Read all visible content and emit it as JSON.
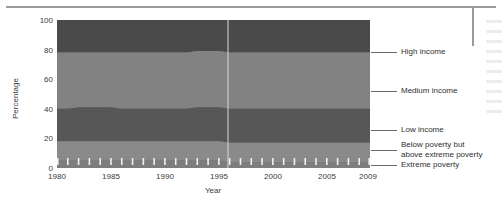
{
  "chart_data": {
    "type": "area",
    "title": "",
    "xlabel": "Year",
    "ylabel": "Percentage",
    "xlim": [
      1980,
      2009
    ],
    "ylim": [
      0,
      100
    ],
    "grid": false,
    "legend_position": "right",
    "stacked": true,
    "x_tick_labels": [
      "1980",
      "1985",
      "1990",
      "1995",
      "2000",
      "2005",
      "2009"
    ],
    "x_tick_values": [
      1980,
      1985,
      1990,
      1995,
      2000,
      2005,
      2009
    ],
    "y_tick_labels": [
      "0",
      "20",
      "40",
      "60",
      "80",
      "100"
    ],
    "y_tick_values": [
      0,
      20,
      40,
      60,
      80,
      100
    ],
    "x": [
      1980,
      1981,
      1982,
      1983,
      1984,
      1985,
      1986,
      1987,
      1988,
      1989,
      1990,
      1991,
      1992,
      1993,
      1994,
      1995,
      1996,
      1997,
      1998,
      1999,
      2000,
      2001,
      2002,
      2003,
      2004,
      2005,
      2006,
      2007,
      2008,
      2009
    ],
    "series": [
      {
        "name": "Extreme poverty",
        "color": "#7d7d7d",
        "values": [
          5,
          5,
          5,
          5,
          5,
          5,
          5,
          5,
          5,
          5,
          5,
          5,
          5,
          5,
          5,
          5,
          4,
          4,
          4,
          4,
          4,
          4,
          4,
          4,
          4,
          4,
          4,
          4,
          4,
          4
        ]
      },
      {
        "name": "Below poverty but above extreme poverty",
        "color": "#8a8a8a",
        "values": [
          13,
          13,
          13,
          13,
          13,
          13,
          13,
          13,
          13,
          13,
          13,
          13,
          13,
          13,
          13,
          13,
          13,
          13,
          13,
          13,
          13,
          13,
          13,
          13,
          13,
          13,
          13,
          13,
          13,
          13
        ]
      },
      {
        "name": "Low income",
        "color": "#575757",
        "values": [
          22,
          22,
          23,
          23,
          23,
          23,
          22,
          22,
          22,
          22,
          22,
          22,
          22,
          23,
          23,
          23,
          23,
          23,
          23,
          23,
          23,
          23,
          23,
          23,
          23,
          23,
          23,
          23,
          23,
          23
        ]
      },
      {
        "name": "Medium income",
        "color": "#828282",
        "values": [
          38,
          38,
          37,
          37,
          37,
          37,
          38,
          38,
          38,
          38,
          38,
          38,
          38,
          38,
          38,
          38,
          38,
          38,
          38,
          38,
          38,
          38,
          38,
          38,
          38,
          38,
          38,
          38,
          38,
          38
        ]
      },
      {
        "name": "High income",
        "color": "#4a4a4a",
        "values": [
          22,
          22,
          22,
          22,
          22,
          22,
          22,
          22,
          22,
          22,
          22,
          22,
          22,
          23,
          23,
          23,
          23,
          23,
          23,
          23,
          22,
          22,
          22,
          22,
          22,
          22,
          22,
          22,
          22,
          22
        ]
      }
    ],
    "cumulative_boundaries": {
      "comment": "top edge of each stacked band, percent, 1980 -> 2009",
      "extreme_poverty_top": [
        5,
        5,
        5,
        5,
        5,
        5,
        5,
        5,
        5,
        5,
        5,
        5,
        5,
        5,
        5,
        5,
        4,
        4,
        4,
        4,
        4,
        4,
        4,
        4,
        4,
        4,
        4,
        4,
        4,
        4
      ],
      "below_poverty_top": [
        18,
        18,
        18,
        18,
        18,
        18,
        18,
        18,
        18,
        18,
        18,
        18,
        18,
        18,
        18,
        18,
        17,
        17,
        17,
        17,
        17,
        17,
        17,
        17,
        17,
        17,
        17,
        17,
        17,
        17
      ],
      "low_income_top": [
        40,
        40,
        41,
        41,
        41,
        41,
        40,
        40,
        40,
        40,
        40,
        40,
        40,
        41,
        41,
        41,
        40,
        40,
        40,
        40,
        40,
        40,
        40,
        40,
        40,
        40,
        40,
        40,
        40,
        40
      ],
      "medium_income_top": [
        78,
        78,
        78,
        78,
        78,
        78,
        78,
        78,
        78,
        78,
        78,
        78,
        78,
        77,
        77,
        77,
        77,
        77,
        77,
        77,
        78,
        78,
        78,
        78,
        78,
        78,
        78,
        78,
        78,
        78
      ],
      "high_income_top": [
        100,
        100,
        100,
        100,
        100,
        100,
        100,
        100,
        100,
        100,
        100,
        100,
        100,
        100,
        100,
        100,
        100,
        100,
        100,
        100,
        100,
        100,
        100,
        100,
        100,
        100,
        100,
        100,
        100,
        100
      ]
    },
    "legend_entries": [
      {
        "label": "High income"
      },
      {
        "label": "Medium income"
      },
      {
        "label": "Low income"
      },
      {
        "label": "Below poverty but",
        "label2": "above extreme poverty"
      },
      {
        "label": "Extreme poverty"
      }
    ]
  }
}
